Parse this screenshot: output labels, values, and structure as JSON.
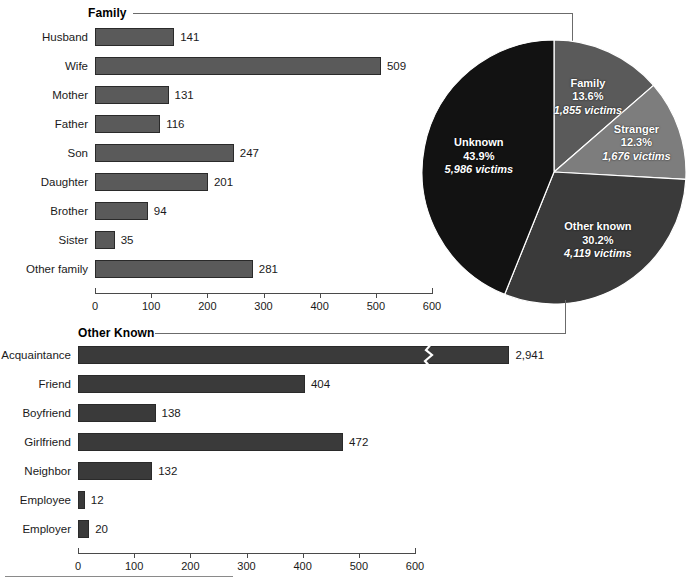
{
  "figure": {
    "footer_rule": true
  },
  "sections": {
    "family": {
      "title": "Family"
    },
    "other_known": {
      "title": "Other Known"
    }
  },
  "chart_data": [
    {
      "type": "bar",
      "orientation": "horizontal",
      "title": "Family",
      "xlabel": "",
      "ylabel": "",
      "xlim": [
        0,
        600
      ],
      "ticks": [
        0,
        100,
        200,
        300,
        400,
        500,
        600
      ],
      "tick_labels": [
        "0",
        "100",
        "200",
        "300",
        "400",
        "500",
        "600"
      ],
      "grid": false,
      "bar_color": "#5a5a5a",
      "categories": [
        "Husband",
        "Wife",
        "Mother",
        "Father",
        "Son",
        "Daughter",
        "Brother",
        "Sister",
        "Other family"
      ],
      "values": [
        141,
        509,
        131,
        116,
        247,
        201,
        94,
        35,
        281
      ],
      "value_labels": [
        "141",
        "509",
        "131",
        "116",
        "247",
        "201",
        "94",
        "35",
        "281"
      ]
    },
    {
      "type": "bar",
      "orientation": "horizontal",
      "title": "Other Known",
      "xlabel": "",
      "ylabel": "",
      "xlim": [
        0,
        600
      ],
      "ticks": [
        0,
        100,
        200,
        300,
        400,
        500,
        600
      ],
      "tick_labels": [
        "0",
        "100",
        "200",
        "300",
        "400",
        "500",
        "600"
      ],
      "grid": false,
      "bar_color": "#3a3a3a",
      "categories": [
        "Acquaintance",
        "Friend",
        "Boyfriend",
        "Girlfriend",
        "Neighbor",
        "Employee",
        "Employer"
      ],
      "values": [
        2941,
        404,
        138,
        472,
        132,
        12,
        20
      ],
      "value_labels": [
        "2,941",
        "404",
        "138",
        "472",
        "132",
        "12",
        "20"
      ],
      "axis_break": {
        "category": "Acquaintance",
        "note": "bar truncated with zigzag break mark"
      }
    },
    {
      "type": "pie",
      "title": "",
      "legend_position": "inside-slices",
      "slices": [
        {
          "name": "Family",
          "percent": 13.6,
          "victims": 1855,
          "percent_label": "13.6%",
          "victims_label": "1,855 victims",
          "color": "#5a5a5a"
        },
        {
          "name": "Stranger",
          "percent": 12.3,
          "victims": 1676,
          "percent_label": "12.3%",
          "victims_label": "1,676 victims",
          "color": "#7d7d7d"
        },
        {
          "name": "Other known",
          "percent": 30.2,
          "victims": 4119,
          "percent_label": "30.2%",
          "victims_label": "4,119 victims",
          "color": "#3a3a3a"
        },
        {
          "name": "Unknown",
          "percent": 43.9,
          "victims": 5986,
          "percent_label": "43.9%",
          "victims_label": "5,986 victims",
          "color": "#121212"
        }
      ]
    }
  ]
}
